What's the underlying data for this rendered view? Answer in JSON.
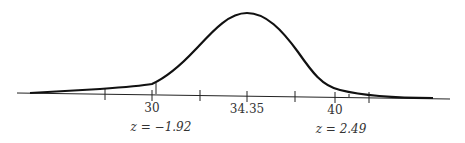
{
  "figure": {
    "type": "normal-distribution-diagram",
    "mean_label": "34.35",
    "ticks": [
      {
        "x": 105,
        "label": ""
      },
      {
        "x": 152,
        "label": "30"
      },
      {
        "x": 200,
        "label": ""
      },
      {
        "x": 247,
        "label": "34.35"
      },
      {
        "x": 295,
        "label": ""
      },
      {
        "x": 335,
        "label": "40"
      },
      {
        "x": 369,
        "label": ""
      }
    ],
    "tick_labels": {
      "left": "30",
      "center": "34.35",
      "right": "40"
    },
    "z_labels": {
      "left": "z = −1.92",
      "right": "z = 2.49"
    },
    "colors": {
      "curve": "#111111",
      "axis": "#222222",
      "text": "#333333"
    }
  }
}
